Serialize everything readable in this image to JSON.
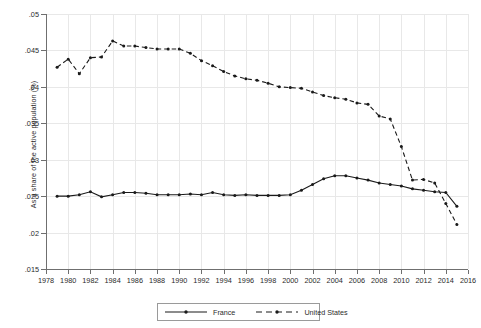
{
  "chart_data": {
    "type": "line",
    "title": "",
    "xlabel": "",
    "ylabel": "As a share of the active population (%)",
    "xlim": [
      1978,
      2016
    ],
    "ylim": [
      0.015,
      0.05
    ],
    "grid": true,
    "legend_position": "bottom-center",
    "xticks": [
      "1978",
      "1980",
      "1982",
      "1984",
      "1986",
      "1988",
      "1990",
      "1992",
      "1994",
      "1996",
      "1998",
      "2000",
      "2002",
      "2004",
      "2006",
      "2008",
      "2010",
      "2012",
      "2014",
      "2016"
    ],
    "yticks": [
      ".015",
      ".02",
      ".025",
      ".03",
      ".035",
      ".04",
      ".045",
      ".05"
    ],
    "ytick_values": [
      0.015,
      0.02,
      0.025,
      0.03,
      0.035,
      0.04,
      0.045,
      0.05
    ],
    "x": [
      1979,
      1980,
      1981,
      1982,
      1983,
      1984,
      1985,
      1986,
      1987,
      1988,
      1989,
      1990,
      1991,
      1992,
      1993,
      1994,
      1995,
      1996,
      1997,
      1998,
      1999,
      2000,
      2001,
      2002,
      2003,
      2004,
      2005,
      2006,
      2007,
      2008,
      2009,
      2010,
      2011,
      2012,
      2013,
      2014,
      2015
    ],
    "series": [
      {
        "name": "France",
        "style": "solid",
        "color": "#1a1a1a",
        "marker": "dot",
        "values": [
          0.025,
          0.025,
          0.0252,
          0.0256,
          0.0249,
          0.0252,
          0.0255,
          0.0255,
          0.0254,
          0.0252,
          0.0252,
          0.0252,
          0.0253,
          0.0252,
          0.0255,
          0.0252,
          0.0251,
          0.0252,
          0.0251,
          0.0251,
          0.0251,
          0.0252,
          0.0258,
          0.0266,
          0.0274,
          0.0278,
          0.0278,
          0.0275,
          0.0272,
          0.0268,
          0.0266,
          0.0264,
          0.026,
          0.0258,
          0.0256,
          0.0255,
          0.0236
        ]
      },
      {
        "name": "United States",
        "style": "dashed",
        "color": "#1a1a1a",
        "marker": "dot",
        "values": [
          0.0427,
          0.0438,
          0.0418,
          0.044,
          0.0441,
          0.0463,
          0.0456,
          0.0456,
          0.0454,
          0.0452,
          0.0452,
          0.0452,
          0.0446,
          0.0436,
          0.0429,
          0.0421,
          0.0415,
          0.0411,
          0.0409,
          0.0405,
          0.04,
          0.0399,
          0.0398,
          0.0393,
          0.0388,
          0.0385,
          0.0383,
          0.0378,
          0.0376,
          0.036,
          0.0356,
          0.0318,
          0.0272,
          0.0273,
          0.0268,
          0.024,
          0.0211
        ]
      }
    ]
  },
  "legend": {
    "items": [
      {
        "label": "France"
      },
      {
        "label": "United States"
      }
    ]
  }
}
